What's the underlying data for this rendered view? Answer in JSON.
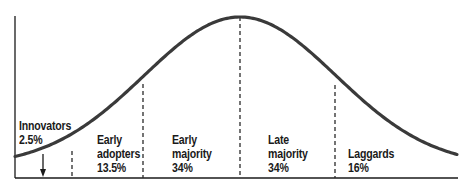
{
  "chart_data": {
    "type": "bell-curve",
    "title": "",
    "xlabel": "",
    "ylabel": "",
    "segments": [
      {
        "name": "Innovators",
        "label_lines": [
          "Innovators",
          "2.5%"
        ],
        "percent": 2.5
      },
      {
        "name": "Early adopters",
        "label_lines": [
          "Early",
          "adopters",
          "13.5%"
        ],
        "percent": 13.5
      },
      {
        "name": "Early majority",
        "label_lines": [
          "Early",
          "majority",
          "34%"
        ],
        "percent": 34
      },
      {
        "name": "Late majority",
        "label_lines": [
          "Late",
          "majority",
          "34%"
        ],
        "percent": 34
      },
      {
        "name": "Laggards",
        "label_lines": [
          "Laggards",
          "16%"
        ],
        "percent": 16
      }
    ],
    "dividers_sd": [
      -2,
      -1,
      0,
      1
    ],
    "grid": false,
    "legend": null
  },
  "labels": {
    "innovators": {
      "line1": "Innovators",
      "line2": "2.5%"
    },
    "early_adopters": {
      "line1": "Early",
      "line2": "adopters",
      "line3": "13.5%"
    },
    "early_majority": {
      "line1": "Early",
      "line2": "majority",
      "line3": "34%"
    },
    "late_majority": {
      "line1": "Late",
      "line2": "majority",
      "line3": "34%"
    },
    "laggards": {
      "line1": "Laggards",
      "line2": "16%"
    }
  },
  "colors": {
    "curve": "#3a3a3a",
    "axis": "#1a1a1a",
    "divider": "#2a2a2a",
    "text": "#1a1a1a",
    "background": "#ffffff"
  }
}
